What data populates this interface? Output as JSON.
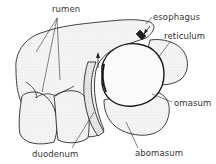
{
  "diagram": {
    "labels": {
      "rumen": "rumen",
      "esophagus": "esophagus",
      "reticulum": "reticulum",
      "omasum": "omasum",
      "abomasum": "abomasum",
      "duodenum": "duodenum"
    },
    "colors": {
      "outline": "#2a2a2a",
      "fill": "#f2f2f2",
      "shade": "#d8d8d8",
      "text": "#333333"
    }
  }
}
